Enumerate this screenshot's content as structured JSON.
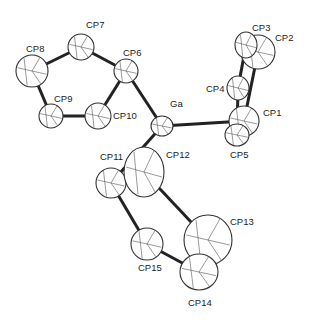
{
  "colors": {
    "bond": "#222222",
    "ellipsoid": "#333333",
    "fill": "#ffffff"
  },
  "atoms": [
    {
      "id": "Ga",
      "label": "Ga",
      "x": 162,
      "y": 126,
      "rx": 11,
      "ry": 10,
      "lx": 170,
      "ly": 99
    },
    {
      "id": "CP1",
      "label": "CP1",
      "x": 244,
      "y": 121,
      "rx": 15,
      "ry": 15,
      "lx": 263,
      "ly": 108
    },
    {
      "id": "CP2",
      "label": "CP2",
      "x": 258,
      "y": 52,
      "rx": 17,
      "ry": 17,
      "lx": 275,
      "ly": 33
    },
    {
      "id": "CP3",
      "label": "CP3",
      "x": 246,
      "y": 45,
      "rx": 11,
      "ry": 13,
      "lx": 252,
      "ly": 23
    },
    {
      "id": "CP4",
      "label": "CP4",
      "x": 238,
      "y": 88,
      "rx": 11,
      "ry": 12,
      "lx": 206,
      "ly": 84
    },
    {
      "id": "CP5",
      "label": "CP5",
      "x": 237,
      "y": 135,
      "rx": 12,
      "ry": 11,
      "lx": 230,
      "ly": 150
    },
    {
      "id": "CP6",
      "label": "CP6",
      "x": 126,
      "y": 71,
      "rx": 12,
      "ry": 12,
      "lx": 123,
      "ly": 48
    },
    {
      "id": "CP7",
      "label": "CP7",
      "x": 81,
      "y": 47,
      "rx": 13,
      "ry": 13,
      "lx": 86,
      "ly": 20
    },
    {
      "id": "CP8",
      "label": "CP8",
      "x": 32,
      "y": 71,
      "rx": 16,
      "ry": 16,
      "lx": 26,
      "ly": 44
    },
    {
      "id": "CP9",
      "label": "CP9",
      "x": 51,
      "y": 116,
      "rx": 12,
      "ry": 12,
      "lx": 54,
      "ly": 94
    },
    {
      "id": "CP10",
      "label": "CP10",
      "x": 98,
      "y": 116,
      "rx": 13,
      "ry": 13,
      "lx": 113,
      "ly": 111
    },
    {
      "id": "CP11",
      "label": "CP11",
      "x": 111,
      "y": 183,
      "rx": 15,
      "ry": 15,
      "lx": 100,
      "ly": 152
    },
    {
      "id": "CP12",
      "label": "CP12",
      "x": 144,
      "y": 172,
      "rx": 20,
      "ry": 25,
      "lx": 166,
      "ly": 150
    },
    {
      "id": "CP13",
      "label": "CP13",
      "x": 208,
      "y": 240,
      "rx": 24,
      "ry": 25,
      "lx": 230,
      "ly": 217
    },
    {
      "id": "CP14",
      "label": "CP14",
      "x": 199,
      "y": 272,
      "rx": 19,
      "ry": 18,
      "lx": 188,
      "ly": 298
    },
    {
      "id": "CP15",
      "label": "CP15",
      "x": 147,
      "y": 244,
      "rx": 16,
      "ry": 16,
      "lx": 138,
      "ly": 263
    }
  ],
  "bonds": [
    [
      "CP6",
      "CP7"
    ],
    [
      "CP7",
      "CP8"
    ],
    [
      "CP8",
      "CP9"
    ],
    [
      "CP9",
      "CP10"
    ],
    [
      "CP10",
      "CP6"
    ],
    [
      "CP6",
      "Ga"
    ],
    [
      "Ga",
      "CP1"
    ],
    [
      "Ga",
      "CP11"
    ],
    [
      "CP1",
      "CP2"
    ],
    [
      "CP3",
      "CP4"
    ],
    [
      "CP4",
      "CP5"
    ],
    [
      "CP2",
      "CP3"
    ],
    [
      "CP1",
      "CP5"
    ],
    [
      "CP11",
      "CP12"
    ],
    [
      "CP12",
      "CP13"
    ],
    [
      "CP13",
      "CP14"
    ],
    [
      "CP14",
      "CP15"
    ],
    [
      "CP15",
      "CP11"
    ]
  ]
}
